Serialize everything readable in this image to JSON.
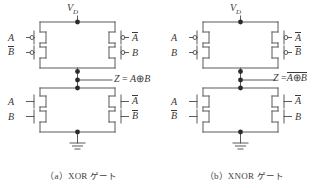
{
  "figure": {
    "panels": [
      {
        "id": "panel-a",
        "caption_index": "（a）",
        "caption_name": "XOR",
        "caption_suffix": "ゲート",
        "supply": {
          "label": "V",
          "sub": "D"
        },
        "ground": "ground-symbol",
        "output": {
          "var": "Z",
          "eq_sign": "=",
          "expr_left": "A",
          "operator": "⊕",
          "expr_right": "B",
          "overbar_whole": false,
          "text": "Z = A ⊕ B"
        },
        "pmos": [
          {
            "pos": "top-left",
            "label": "A",
            "overbar": false,
            "bubble": true
          },
          {
            "pos": "bottom-left",
            "label": "B",
            "overbar": true,
            "bubble": true
          },
          {
            "pos": "top-right",
            "label": "A",
            "overbar": true,
            "bubble": true
          },
          {
            "pos": "bottom-right",
            "label": "B",
            "overbar": false,
            "bubble": true
          }
        ],
        "nmos": [
          {
            "pos": "top-left",
            "label": "A",
            "overbar": false,
            "bubble": false
          },
          {
            "pos": "bottom-left",
            "label": "B",
            "overbar": false,
            "bubble": false
          },
          {
            "pos": "top-right",
            "label": "A",
            "overbar": true,
            "bubble": false
          },
          {
            "pos": "bottom-right",
            "label": "B",
            "overbar": true,
            "bubble": false
          }
        ]
      },
      {
        "id": "panel-b",
        "caption_index": "（b）",
        "caption_name": "XNOR",
        "caption_suffix": "ゲート",
        "supply": {
          "label": "V",
          "sub": "D"
        },
        "ground": "ground-symbol",
        "output": {
          "var": "Z",
          "eq_sign": "=",
          "expr_left": "A",
          "operator": "⊕",
          "expr_right": "B",
          "overbar_whole": true,
          "text": "Z = A ⊕ B (overbar)"
        },
        "pmos": [
          {
            "pos": "top-left",
            "label": "A",
            "overbar": false,
            "bubble": true
          },
          {
            "pos": "bottom-left",
            "label": "B",
            "overbar": false,
            "bubble": true
          },
          {
            "pos": "top-right",
            "label": "A",
            "overbar": true,
            "bubble": true
          },
          {
            "pos": "bottom-right",
            "label": "B",
            "overbar": true,
            "bubble": true
          }
        ],
        "nmos": [
          {
            "pos": "top-left",
            "label": "A",
            "overbar": false,
            "bubble": false
          },
          {
            "pos": "bottom-left",
            "label": "B",
            "overbar": true,
            "bubble": false
          },
          {
            "pos": "top-right",
            "label": "A",
            "overbar": true,
            "bubble": false
          },
          {
            "pos": "bottom-right",
            "label": "B",
            "overbar": false,
            "bubble": false
          }
        ]
      }
    ],
    "colors": {
      "wire": "#5a5a5a",
      "text": "#3a3a3a",
      "node": "#2b2b2b",
      "background": "#ffffff"
    }
  }
}
